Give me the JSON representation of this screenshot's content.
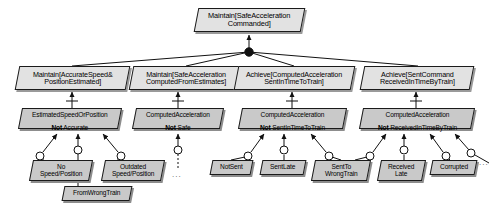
{
  "diagram": {
    "type": "goal-obstacle-tree",
    "colors": {
      "goal_fill": "#e2e2e2",
      "obstacle_fill": "#c9c9c9",
      "leaf_fill": "#c9c9c9",
      "stroke": "#1a1a1a",
      "shadow": "#9a9a9a",
      "background": "#ffffff"
    },
    "root": {
      "id": "root",
      "kind": "goal",
      "label": "Maintain[SafeAcceleration\nCommanded]",
      "x": 196,
      "y": 8,
      "w": 107,
      "h": 24
    },
    "refinement": {
      "kind": "and-node",
      "label": "and-refinement-junction",
      "x": 249,
      "y": 52,
      "r": 4
    },
    "goals": [
      {
        "id": "g1",
        "kind": "goal",
        "label": "Maintain[AccurateSpeed&\nPositionEstimated]",
        "x": 17,
        "y": 66,
        "w": 111,
        "h": 24
      },
      {
        "id": "g2",
        "kind": "goal",
        "label": "Maintain[SafeAcceleration\nComputedFromEstimates]",
        "x": 131,
        "y": 66,
        "w": 111,
        "h": 24
      },
      {
        "id": "g3",
        "kind": "goal",
        "label": "Achieve[ComputedAcceleration\nSentInTimeToTrain]",
        "x": 236,
        "y": 66,
        "w": 117,
        "h": 24
      },
      {
        "id": "g4",
        "kind": "goal",
        "label": "Achieve[SentCommand\nReceivedInTimeByTrain]",
        "x": 362,
        "y": 66,
        "w": 110,
        "h": 24
      }
    ],
    "obstacles": [
      {
        "id": "o1",
        "kind": "obstacle",
        "line1": "EstimatedSpeedOrPosition",
        "neg": "Not",
        "rest": " Accurate",
        "x": 20,
        "y": 108,
        "w": 100,
        "h": 21,
        "obstructs": "g1"
      },
      {
        "id": "o2",
        "kind": "obstacle",
        "line1": "ComputedAcceleration",
        "neg": "Not",
        "rest": " Safe",
        "x": 134,
        "y": 108,
        "w": 88,
        "h": 21,
        "obstructs": "g2"
      },
      {
        "id": "o3",
        "kind": "obstacle",
        "line1": "ComputedAcceleration",
        "neg": "Not",
        "rest": " SentInTimeToTrain",
        "x": 240,
        "y": 108,
        "w": 105,
        "h": 21,
        "obstructs": "g3"
      },
      {
        "id": "o4",
        "kind": "obstacle",
        "line1": "ComputedAcceleration",
        "neg": "Not",
        "rest": " ReceivedInTimeByTrain",
        "x": 361,
        "y": 108,
        "w": 112,
        "h": 21,
        "obstructs": "g4"
      }
    ],
    "leaves": [
      {
        "id": "l1",
        "label": "No\nSpeed/Position",
        "x": 31,
        "y": 160,
        "w": 60,
        "h": 21,
        "parent": "o1"
      },
      {
        "id": "l2",
        "label": "FromWrongTrain",
        "x": 63,
        "y": 186,
        "w": 68,
        "h": 15,
        "parent": "o1"
      },
      {
        "id": "l3",
        "label": "Outdated\nSpeed/Position",
        "x": 103,
        "y": 160,
        "w": 60,
        "h": 21,
        "parent": "o1"
      },
      {
        "id": "l4",
        "label": "NotSent",
        "x": 211,
        "y": 160,
        "w": 41,
        "h": 15,
        "parent": "o3"
      },
      {
        "id": "l5",
        "label": "SentLate",
        "x": 261,
        "y": 160,
        "w": 44,
        "h": 15,
        "parent": "o3"
      },
      {
        "id": "l6",
        "label": "SentTo\nWrongTrain",
        "x": 313,
        "y": 160,
        "w": 56,
        "h": 21,
        "parent": "o3"
      },
      {
        "id": "l7",
        "label": "Received\nLate",
        "x": 379,
        "y": 160,
        "w": 45,
        "h": 21,
        "parent": "o4"
      },
      {
        "id": "l8",
        "label": "Corrupted",
        "x": 431,
        "y": 160,
        "w": 45,
        "h": 15,
        "parent": "o4"
      }
    ],
    "ellipses": [
      {
        "id": "e1",
        "label": "...",
        "x": 172,
        "y": 170
      },
      {
        "id": "e2",
        "label": "...",
        "x": 479,
        "y": 158
      }
    ]
  }
}
